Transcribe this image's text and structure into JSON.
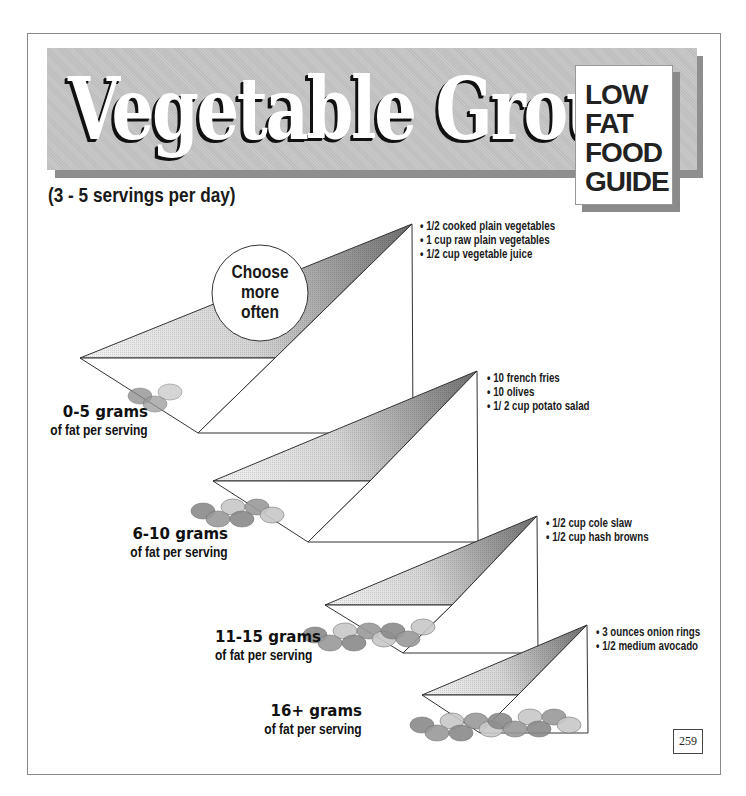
{
  "header": {
    "title": "Vegetable Group",
    "badge_lines": [
      "LOW",
      "FAT",
      "FOOD",
      "GUIDE"
    ],
    "subtitle": "(3 - 5 servings per day)"
  },
  "callout": {
    "lines": [
      "Choose",
      "more",
      "often"
    ]
  },
  "tiers": [
    {
      "fat_range": "0-5 grams",
      "fat_unit": "of fat per serving",
      "foods": [
        "1/2 cooked plain vegetables",
        "1 cup raw plain vegetables",
        "1/2 cup vegetable juice"
      ],
      "scoop_count": 3
    },
    {
      "fat_range": "6-10 grams",
      "fat_unit": "of fat per serving",
      "foods": [
        "10 french fries",
        "10 olives",
        "1/ 2 cup potato salad"
      ],
      "scoop_count": 6
    },
    {
      "fat_range": "11-15 grams",
      "fat_unit": "of fat per serving",
      "foods": [
        "1/2 cup cole slaw",
        "1/2 cup hash browns"
      ],
      "scoop_count": 9
    },
    {
      "fat_range": "16+ grams",
      "fat_unit": "of fat per serving",
      "foods": [
        "3 ounces onion rings",
        "1/2 medium avocado"
      ],
      "scoop_count": 12
    }
  ],
  "colors": {
    "banner": "#c4c4c4",
    "banner_shadow": "#8e8e8e",
    "wedge_dark": "#6f6f6f",
    "wedge_light": "#f2f2f2",
    "fat_drop": "#8a8a8a"
  },
  "page_number": "259"
}
